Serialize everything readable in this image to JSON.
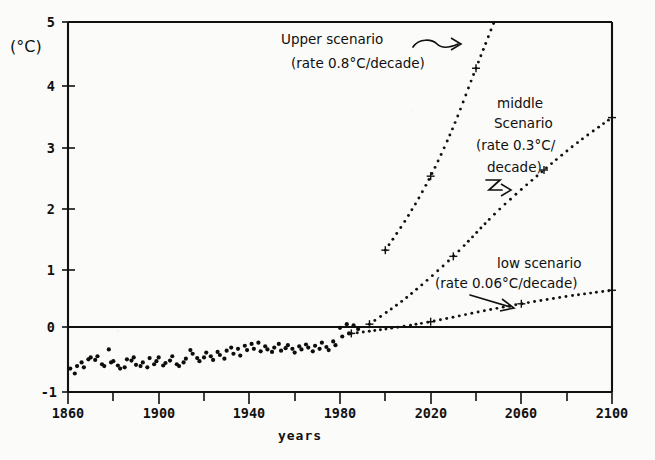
{
  "chart_data": {
    "type": "line",
    "title": "",
    "xlabel": "years",
    "ylabel": "(°C)",
    "xlim": [
      1860,
      2100
    ],
    "ylim": [
      -1,
      5
    ],
    "grid": false,
    "legend_position": "inline-annotations",
    "x_ticks_major": [
      1860,
      1900,
      1940,
      1980,
      2020,
      2060,
      2100
    ],
    "x_ticks_major_labels": [
      "1860",
      "1900",
      "1940",
      "1980",
      "2020",
      "2060",
      "2100"
    ],
    "x_ticks_minor": [
      1880,
      1920,
      1960,
      2000,
      2040,
      2080
    ],
    "y_ticks": [
      -1,
      0,
      1,
      2,
      3,
      4,
      5
    ],
    "y_tick_labels": [
      "-1",
      "0",
      "1",
      "2",
      "3",
      "4",
      "5"
    ],
    "zero_reference_line": 0,
    "series": [
      {
        "name": "observed",
        "style": "scatter",
        "x": [
          1861,
          1863,
          1864,
          1866,
          1867,
          1869,
          1870,
          1872,
          1873,
          1875,
          1876,
          1878,
          1879,
          1880,
          1882,
          1883,
          1885,
          1886,
          1888,
          1889,
          1890,
          1892,
          1893,
          1895,
          1896,
          1898,
          1899,
          1900,
          1902,
          1903,
          1905,
          1906,
          1908,
          1909,
          1911,
          1912,
          1914,
          1915,
          1917,
          1918,
          1920,
          1921,
          1923,
          1924,
          1926,
          1927,
          1929,
          1930,
          1932,
          1933,
          1935,
          1936,
          1938,
          1939,
          1941,
          1942,
          1944,
          1945,
          1947,
          1948,
          1950,
          1951,
          1953,
          1954,
          1956,
          1957,
          1959,
          1960,
          1962,
          1963,
          1965,
          1966,
          1968,
          1969,
          1971,
          1972,
          1974,
          1975,
          1977,
          1978,
          1980,
          1981,
          1983,
          1984,
          1986,
          1988
        ],
        "y": [
          -0.62,
          -0.7,
          -0.58,
          -0.52,
          -0.6,
          -0.47,
          -0.44,
          -0.48,
          -0.42,
          -0.55,
          -0.58,
          -0.31,
          -0.52,
          -0.5,
          -0.57,
          -0.62,
          -0.6,
          -0.47,
          -0.49,
          -0.44,
          -0.56,
          -0.58,
          -0.52,
          -0.6,
          -0.45,
          -0.55,
          -0.5,
          -0.44,
          -0.57,
          -0.53,
          -0.49,
          -0.42,
          -0.55,
          -0.58,
          -0.52,
          -0.46,
          -0.32,
          -0.38,
          -0.45,
          -0.5,
          -0.44,
          -0.36,
          -0.42,
          -0.48,
          -0.35,
          -0.4,
          -0.46,
          -0.33,
          -0.28,
          -0.38,
          -0.3,
          -0.41,
          -0.25,
          -0.32,
          -0.22,
          -0.3,
          -0.2,
          -0.34,
          -0.26,
          -0.31,
          -0.35,
          -0.28,
          -0.22,
          -0.33,
          -0.29,
          -0.24,
          -0.3,
          -0.36,
          -0.26,
          -0.31,
          -0.23,
          -0.28,
          -0.34,
          -0.25,
          -0.3,
          -0.2,
          -0.27,
          -0.32,
          -0.18,
          -0.24,
          0.04,
          -0.1,
          0.1,
          -0.05,
          0.08,
          0.02
        ]
      },
      {
        "name": "Upper scenario",
        "style": "dotted",
        "rate_c_per_decade": 0.8,
        "x": [
          2000,
          2010,
          2020,
          2030,
          2040,
          2048
        ],
        "y": [
          1.3,
          1.85,
          2.5,
          3.3,
          4.25,
          5.0
        ]
      },
      {
        "name": "middle scenario",
        "style": "dotted",
        "rate_c_per_decade": 0.3,
        "x": [
          1993,
          2010,
          2030,
          2050,
          2070,
          2085,
          2100
        ],
        "y": [
          0.1,
          0.55,
          1.2,
          1.95,
          2.6,
          3.05,
          3.45
        ]
      },
      {
        "name": "low scenario",
        "style": "dotted",
        "rate_c_per_decade": 0.06,
        "x": [
          1985,
          2000,
          2020,
          2040,
          2060,
          2080,
          2100
        ],
        "y": [
          -0.05,
          0.02,
          0.14,
          0.29,
          0.43,
          0.55,
          0.65
        ]
      }
    ],
    "annotations": [
      {
        "name": "upper-scenario-annotation",
        "line1": "Upper scenario",
        "line2": "(rate 0.8°C/decade)",
        "arrow": "squiggle-right"
      },
      {
        "name": "middle-scenario-annotation",
        "line1": "middle",
        "line2": "Scenario",
        "line3": "(rate 0.3°C/",
        "line4": "decade)",
        "arrow": "squiggle-right"
      },
      {
        "name": "low-scenario-annotation",
        "line1": "low scenario",
        "line2": "(rate 0.06°C/decade)",
        "arrow": "straight-right"
      }
    ]
  },
  "axes": {
    "y_unit_label": "(°C)",
    "x_title": "years",
    "y_tick_5": "5",
    "y_tick_4": "4",
    "y_tick_3": "3",
    "y_tick_2": "2",
    "y_tick_1": "1",
    "y_tick_0": "0",
    "y_tick_m1": "-1",
    "x_tick_1860": "1860",
    "x_tick_1900": "1900",
    "x_tick_1940": "1940",
    "x_tick_1980": "1980",
    "x_tick_2020": "2020",
    "x_tick_2060": "2060",
    "x_tick_2100": "2100"
  },
  "annotations": {
    "upper_line1": "Upper scenario",
    "upper_line2": "(rate 0.8°C/decade)",
    "middle_line1": "middle",
    "middle_line2": "Scenario",
    "middle_line3": "(rate 0.3°C/",
    "middle_line4": "decade)",
    "low_line1": "low scenario",
    "low_line2": "(rate 0.06°C/decade)"
  },
  "colors": {
    "ink": "#111111",
    "paper": "#fbfbf9"
  }
}
